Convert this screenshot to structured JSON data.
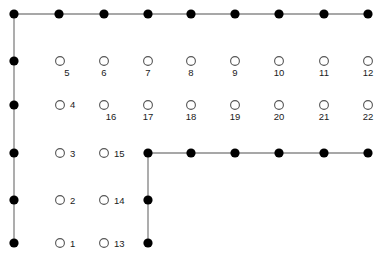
{
  "diagram": {
    "title": "",
    "canvas": {
      "width": 378,
      "height": 261
    },
    "colors": {
      "background": "#ffffff",
      "edge": "#8a8a8a",
      "filled_node": "#000000",
      "open_node_stroke": "#555555",
      "open_node_fill": "#ffffff",
      "label": "#1a1a1a"
    },
    "geometry": {
      "columns_x": [
        14,
        59,
        104,
        148,
        191,
        235,
        279,
        324,
        368
      ],
      "rows_y": [
        14,
        61,
        105,
        153,
        200,
        243
      ],
      "filled_radius": 4.6,
      "open_radius": 4.4
    },
    "filled_nodes": [
      {
        "id": "n-r0-c0",
        "x": 14,
        "y": 14
      },
      {
        "id": "n-r0-c1",
        "x": 59,
        "y": 14
      },
      {
        "id": "n-r0-c2",
        "x": 104,
        "y": 14
      },
      {
        "id": "n-r0-c3",
        "x": 148,
        "y": 14
      },
      {
        "id": "n-r0-c4",
        "x": 191,
        "y": 14
      },
      {
        "id": "n-r0-c5",
        "x": 235,
        "y": 14
      },
      {
        "id": "n-r0-c6",
        "x": 279,
        "y": 14
      },
      {
        "id": "n-r0-c7",
        "x": 324,
        "y": 14
      },
      {
        "id": "n-r0-c8",
        "x": 368,
        "y": 14
      },
      {
        "id": "n-r1-c0",
        "x": 14,
        "y": 61
      },
      {
        "id": "n-r2-c0",
        "x": 14,
        "y": 105
      },
      {
        "id": "n-r3-c0",
        "x": 14,
        "y": 153
      },
      {
        "id": "n-r4-c0",
        "x": 14,
        "y": 200
      },
      {
        "id": "n-r5-c0",
        "x": 14,
        "y": 243
      },
      {
        "id": "n-r3-c3",
        "x": 148,
        "y": 153
      },
      {
        "id": "n-r3-c4",
        "x": 191,
        "y": 153
      },
      {
        "id": "n-r3-c5",
        "x": 235,
        "y": 153
      },
      {
        "id": "n-r3-c6",
        "x": 279,
        "y": 153
      },
      {
        "id": "n-r3-c7",
        "x": 324,
        "y": 153
      },
      {
        "id": "n-r3-c8",
        "x": 368,
        "y": 153
      },
      {
        "id": "n-r4-c3",
        "x": 148,
        "y": 200
      },
      {
        "id": "n-r5-c3",
        "x": 148,
        "y": 243
      }
    ],
    "edges": [
      {
        "id": "e-top-1",
        "x1": 14,
        "y1": 14,
        "x2": 59,
        "y2": 14
      },
      {
        "id": "e-top-2",
        "x1": 59,
        "y1": 14,
        "x2": 104,
        "y2": 14
      },
      {
        "id": "e-top-3",
        "x1": 104,
        "y1": 14,
        "x2": 148,
        "y2": 14
      },
      {
        "id": "e-top-4",
        "x1": 148,
        "y1": 14,
        "x2": 191,
        "y2": 14
      },
      {
        "id": "e-top-5",
        "x1": 191,
        "y1": 14,
        "x2": 235,
        "y2": 14
      },
      {
        "id": "e-top-6",
        "x1": 235,
        "y1": 14,
        "x2": 279,
        "y2": 14
      },
      {
        "id": "e-top-7",
        "x1": 279,
        "y1": 14,
        "x2": 324,
        "y2": 14
      },
      {
        "id": "e-top-8",
        "x1": 324,
        "y1": 14,
        "x2": 368,
        "y2": 14
      },
      {
        "id": "e-left-1",
        "x1": 14,
        "y1": 14,
        "x2": 14,
        "y2": 61
      },
      {
        "id": "e-left-2",
        "x1": 14,
        "y1": 61,
        "x2": 14,
        "y2": 105
      },
      {
        "id": "e-left-3",
        "x1": 14,
        "y1": 105,
        "x2": 14,
        "y2": 153
      },
      {
        "id": "e-left-4",
        "x1": 14,
        "y1": 153,
        "x2": 14,
        "y2": 200
      },
      {
        "id": "e-left-5",
        "x1": 14,
        "y1": 200,
        "x2": 14,
        "y2": 243
      },
      {
        "id": "e-mid-1",
        "x1": 148,
        "y1": 153,
        "x2": 191,
        "y2": 153
      },
      {
        "id": "e-mid-2",
        "x1": 191,
        "y1": 153,
        "x2": 235,
        "y2": 153
      },
      {
        "id": "e-mid-3",
        "x1": 235,
        "y1": 153,
        "x2": 279,
        "y2": 153
      },
      {
        "id": "e-mid-4",
        "x1": 279,
        "y1": 153,
        "x2": 324,
        "y2": 153
      },
      {
        "id": "e-mid-5",
        "x1": 324,
        "y1": 153,
        "x2": 368,
        "y2": 153
      },
      {
        "id": "e-drop-1",
        "x1": 148,
        "y1": 153,
        "x2": 148,
        "y2": 200
      },
      {
        "id": "e-drop-2",
        "x1": 148,
        "y1": 200,
        "x2": 148,
        "y2": 243
      }
    ],
    "open_nodes": [
      {
        "label": "5",
        "x": 60,
        "y": 61,
        "lx": 67,
        "ly": 76,
        "anchor": "middle",
        "label_position": "below-right"
      },
      {
        "label": "6",
        "x": 104,
        "y": 61,
        "lx": 104,
        "ly": 76,
        "anchor": "middle",
        "label_position": "below"
      },
      {
        "label": "7",
        "x": 148,
        "y": 61,
        "lx": 148,
        "ly": 76,
        "anchor": "middle",
        "label_position": "below"
      },
      {
        "label": "8",
        "x": 191,
        "y": 61,
        "lx": 191,
        "ly": 76,
        "anchor": "middle",
        "label_position": "below"
      },
      {
        "label": "9",
        "x": 235,
        "y": 61,
        "lx": 235,
        "ly": 76,
        "anchor": "middle",
        "label_position": "below"
      },
      {
        "label": "10",
        "x": 279,
        "y": 61,
        "lx": 279,
        "ly": 76,
        "anchor": "middle",
        "label_position": "below"
      },
      {
        "label": "11",
        "x": 324,
        "y": 61,
        "lx": 324,
        "ly": 76,
        "anchor": "middle",
        "label_position": "below"
      },
      {
        "label": "12",
        "x": 368,
        "y": 61,
        "lx": 368,
        "ly": 76,
        "anchor": "middle",
        "label_position": "below"
      },
      {
        "label": "4",
        "x": 60,
        "y": 105,
        "lx": 70,
        "ly": 108,
        "anchor": "start",
        "label_position": "right"
      },
      {
        "label": "16",
        "x": 104,
        "y": 105,
        "lx": 111,
        "ly": 120,
        "anchor": "middle",
        "label_position": "below-right"
      },
      {
        "label": "17",
        "x": 148,
        "y": 105,
        "lx": 148,
        "ly": 120,
        "anchor": "middle",
        "label_position": "below"
      },
      {
        "label": "18",
        "x": 191,
        "y": 105,
        "lx": 191,
        "ly": 120,
        "anchor": "middle",
        "label_position": "below"
      },
      {
        "label": "19",
        "x": 235,
        "y": 105,
        "lx": 235,
        "ly": 120,
        "anchor": "middle",
        "label_position": "below"
      },
      {
        "label": "20",
        "x": 279,
        "y": 105,
        "lx": 279,
        "ly": 120,
        "anchor": "middle",
        "label_position": "below"
      },
      {
        "label": "21",
        "x": 324,
        "y": 105,
        "lx": 324,
        "ly": 120,
        "anchor": "middle",
        "label_position": "below"
      },
      {
        "label": "22",
        "x": 368,
        "y": 105,
        "lx": 368,
        "ly": 120,
        "anchor": "middle",
        "label_position": "below"
      },
      {
        "label": "3",
        "x": 60,
        "y": 153,
        "lx": 70,
        "ly": 157,
        "anchor": "start",
        "label_position": "right"
      },
      {
        "label": "15",
        "x": 104,
        "y": 153,
        "lx": 114,
        "ly": 157,
        "anchor": "start",
        "label_position": "right"
      },
      {
        "label": "2",
        "x": 60,
        "y": 200,
        "lx": 70,
        "ly": 204,
        "anchor": "start",
        "label_position": "right"
      },
      {
        "label": "14",
        "x": 104,
        "y": 200,
        "lx": 114,
        "ly": 204,
        "anchor": "start",
        "label_position": "right"
      },
      {
        "label": "1",
        "x": 60,
        "y": 243,
        "lx": 70,
        "ly": 247,
        "anchor": "start",
        "label_position": "right"
      },
      {
        "label": "13",
        "x": 104,
        "y": 243,
        "lx": 114,
        "ly": 247,
        "anchor": "start",
        "label_position": "right"
      }
    ]
  }
}
